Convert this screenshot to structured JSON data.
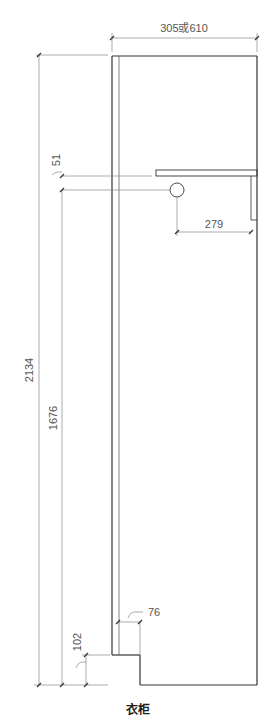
{
  "diagram": {
    "caption": "衣柜",
    "dimensions": {
      "depth": "305或610",
      "total_height": "2134",
      "rod_height": "1676",
      "shelf_to_rod": "51",
      "rod_to_back": "279",
      "toe_kick_height": "102",
      "toe_kick_depth": "76"
    },
    "colors": {
      "outline": "#333333",
      "dimension_line": "#888888",
      "text": "#555555"
    }
  }
}
